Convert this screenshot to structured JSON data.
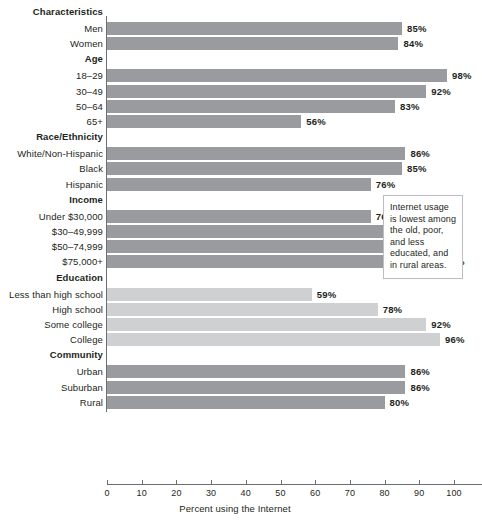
{
  "chart_data": {
    "type": "bar",
    "orientation": "horizontal",
    "title": "",
    "xlabel": "Percent using the Internet",
    "ylabel": "",
    "xlim": [
      0,
      108
    ],
    "xticks": [
      0,
      10,
      20,
      30,
      40,
      50,
      60,
      70,
      80,
      90,
      100
    ],
    "grid": false,
    "legend": null,
    "value_suffix": "%",
    "groups": [
      {
        "group_label": "Characteristics",
        "categories": [
          "Men",
          "Women"
        ],
        "values": [
          85,
          84
        ],
        "value_labels": [
          "85%",
          "84%"
        ]
      },
      {
        "group_label": "Age",
        "categories": [
          "18–29",
          "30–49",
          "50–64",
          "65+"
        ],
        "values": [
          98,
          92,
          83,
          56
        ],
        "value_labels": [
          "98%",
          "92%",
          "83%",
          "56%"
        ]
      },
      {
        "group_label": "Race/Ethnicity",
        "categories": [
          "White/Non-Hispanic",
          "Black",
          "Hispanic"
        ],
        "values": [
          86,
          85,
          76
        ],
        "value_labels": [
          "86%",
          "85%",
          "76%"
        ]
      },
      {
        "group_label": "Income",
        "categories": [
          "Under $30,000",
          "$30–49,999",
          "$50–74,999",
          "$75,000+"
        ],
        "values": [
          76,
          88,
          94,
          96
        ],
        "value_labels": [
          "76%",
          "88%",
          "94%",
          "96%"
        ]
      },
      {
        "group_label": "Education",
        "categories": [
          "Less than high school",
          "High school",
          "Some college",
          "College"
        ],
        "values": [
          59,
          78,
          92,
          96
        ],
        "value_labels": [
          "59%",
          "78%",
          "92%",
          "96%"
        ]
      },
      {
        "group_label": "Community",
        "categories": [
          "Urban",
          "Suburban",
          "Rural"
        ],
        "values": [
          86,
          86,
          80
        ],
        "value_labels": [
          "86%",
          "86%",
          "80%"
        ]
      }
    ]
  },
  "annotation": {
    "text": "Internet usage is lowest among the old, poor, and less educated, and in rural areas."
  },
  "colors": {
    "bar_dark": "#9a9b9e",
    "bar_light": "#cfd0d2",
    "axis": "#6d6e71",
    "text": "#231f20",
    "callout_border": "#bcbec0",
    "background": "#ffffff"
  }
}
